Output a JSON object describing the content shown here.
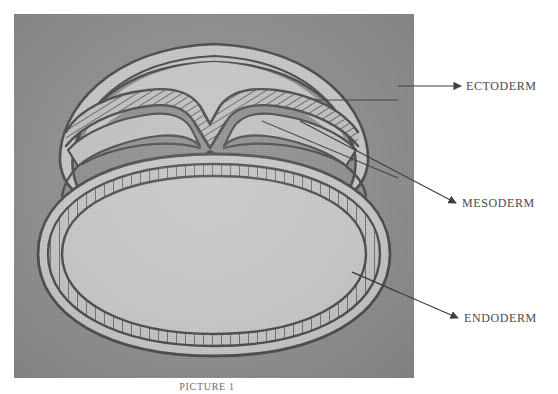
{
  "figure": {
    "domain": "scientific-illustration",
    "caption": "PICTURE 1",
    "plate": {
      "background_color": "#909090",
      "interior_color": "#c8c8c8",
      "ink_color": "#4a4a4a",
      "left": 14,
      "top": 14,
      "width": 400,
      "height": 364
    }
  },
  "labels": [
    {
      "id": "ectoderm",
      "text": "ECTODERM",
      "arrow": {
        "from_x": 398,
        "from_y": 86,
        "to_x": 461,
        "to_y": 86
      },
      "color": "#4a4a4a"
    },
    {
      "id": "mesoderm",
      "text": "MESODERM",
      "arrow": {
        "from_x": 262,
        "from_y": 121,
        "to_x": 456,
        "to_y": 203
      },
      "color": "#4a4a4a"
    },
    {
      "id": "endoderm",
      "text": "ENDODERM",
      "arrow": {
        "from_x": 352,
        "from_y": 272,
        "to_x": 458,
        "to_y": 318
      },
      "color": "#4a4a4a"
    }
  ],
  "structures": [
    {
      "id": "amnion-outer-fold",
      "name": "outer amniotic fold",
      "style": "plain outline"
    },
    {
      "id": "amniotic-cavity",
      "name": "amniotic cavity",
      "style": "open space"
    },
    {
      "id": "ectoderm-layer",
      "name": "ectoderm layer",
      "style": "hatched band"
    },
    {
      "id": "neural-groove",
      "name": "neural groove",
      "style": "central invagination"
    },
    {
      "id": "mesoderm-layer",
      "name": "mesoderm layer",
      "style": "hatched band"
    },
    {
      "id": "endoderm-layer",
      "name": "endoderm layer",
      "style": "bricked columnar band"
    },
    {
      "id": "yolk-sac-cavity",
      "name": "yolk sac cavity",
      "style": "large oval space"
    }
  ]
}
